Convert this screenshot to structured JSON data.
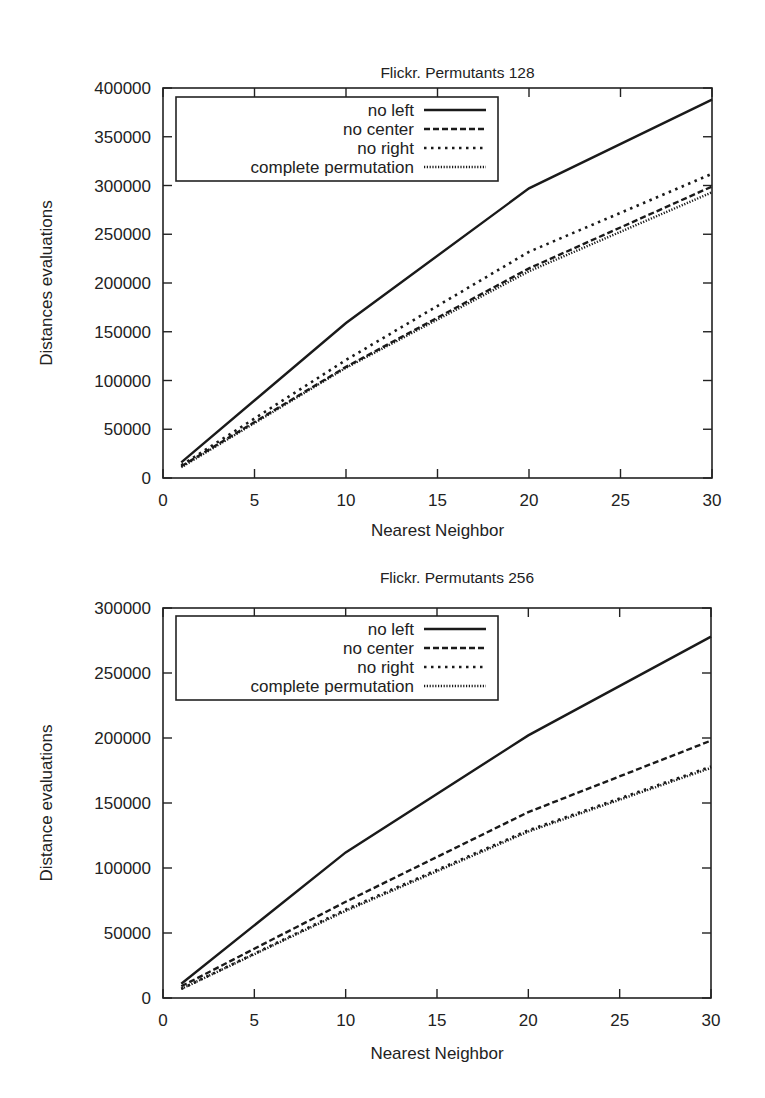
{
  "chart_data": [
    {
      "type": "line",
      "title": "Flickr. Permutants 128",
      "xlabel": "Nearest Neighbor",
      "ylabel": "Distances evaluations",
      "xlim": [
        0,
        30
      ],
      "ylim": [
        0,
        400000
      ],
      "xticks": [
        0,
        5,
        10,
        15,
        20,
        25,
        30
      ],
      "yticks": [
        0,
        50000,
        100000,
        150000,
        200000,
        250000,
        300000,
        350000,
        400000
      ],
      "grid": false,
      "legend_position": "upper left",
      "x": [
        1,
        10,
        20,
        30
      ],
      "series": [
        {
          "name": "no left",
          "style": "solid",
          "values": [
            16000,
            159000,
            297000,
            388000
          ]
        },
        {
          "name": "no center",
          "style": "dashed",
          "values": [
            12000,
            114000,
            215000,
            299000
          ]
        },
        {
          "name": "no right",
          "style": "dotted",
          "values": [
            13000,
            121000,
            232000,
            312000
          ]
        },
        {
          "name": "complete permutation",
          "style": "fine-dotted",
          "values": [
            11000,
            113000,
            212000,
            293000
          ]
        }
      ]
    },
    {
      "type": "line",
      "title": "Flickr. Permutants 256",
      "xlabel": "Nearest Neighbor",
      "ylabel": "Distance evaluations",
      "xlim": [
        0,
        30
      ],
      "ylim": [
        0,
        300000
      ],
      "xticks": [
        0,
        5,
        10,
        15,
        20,
        25,
        30
      ],
      "yticks": [
        0,
        50000,
        100000,
        150000,
        200000,
        250000,
        300000
      ],
      "grid": false,
      "legend_position": "upper left",
      "x": [
        1,
        10,
        20,
        30
      ],
      "series": [
        {
          "name": "no left",
          "style": "solid",
          "values": [
            11000,
            112000,
            202000,
            278000
          ]
        },
        {
          "name": "no center",
          "style": "dashed",
          "values": [
            9000,
            74000,
            143000,
            198000
          ]
        },
        {
          "name": "no right",
          "style": "dotted",
          "values": [
            7000,
            68000,
            129000,
            178000
          ]
        },
        {
          "name": "complete permutation",
          "style": "fine-dotted",
          "values": [
            7000,
            67000,
            128000,
            177000
          ]
        }
      ]
    }
  ]
}
